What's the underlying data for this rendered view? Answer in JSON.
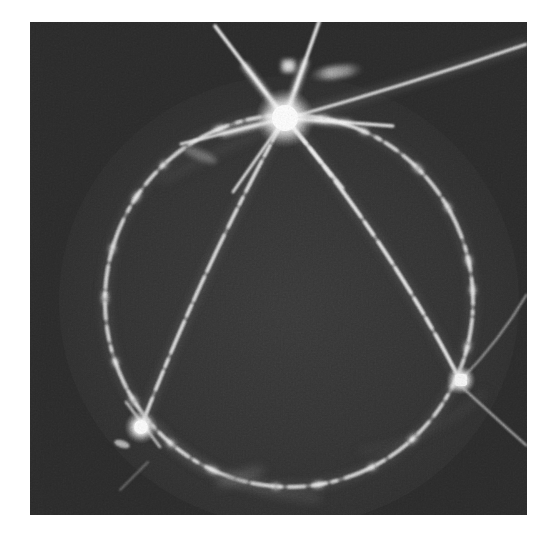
{
  "document": {
    "type": "photographic-plate-image",
    "medium": "grayscale halftone scan",
    "background_page_color": "#ffffff",
    "plate": {
      "x": 30,
      "y": 22,
      "width": 497,
      "height": 493,
      "background_color": "#2b2b2b",
      "interior_color": "#343434",
      "grain": "heavy film grain / halftone noise"
    }
  },
  "scene": {
    "description": "Long-exposure dark-field photograph showing a bright central star burst with six diffraction rays, a large dashed luminous circle, two chord arcs meeting at lower nodes, and a long sweeping streak to the upper right.",
    "feature_count": 9
  },
  "features": {
    "nodes": [
      {
        "id": "node-top",
        "label": "central burst",
        "cx": 285,
        "cy": 118,
        "radius": 17,
        "brightness": "#ffffff",
        "ray_count": 6,
        "notes": "brightest point, six-pointed diffraction spikes"
      },
      {
        "id": "node-lower-left",
        "label": "lower-left node",
        "cx": 141,
        "cy": 427,
        "radius": 9,
        "brightness": "#fdfdfd",
        "ray_count": 4,
        "notes": "secondary bright knot where chord meets circle"
      },
      {
        "id": "node-right",
        "label": "right node",
        "cx": 461,
        "cy": 380,
        "radius": 8,
        "brightness": "#f8f8f8",
        "ray_count": 4,
        "notes": "third bright knot where chord meets circle"
      }
    ],
    "circle": {
      "id": "main-circle",
      "label": "dashed luminous circle",
      "cx": 289,
      "cy": 301,
      "rx": 184,
      "ry": 186,
      "stroke_color": "#d8d8d8",
      "stroke_width": 3,
      "style": "dashed / beaded with bright knots",
      "rotation_deg": -4
    },
    "chords": [
      {
        "id": "chord-left",
        "label": "chord from burst to lower-left node",
        "from": [
          285,
          118
        ],
        "to": [
          141,
          427
        ],
        "curve_control": [
          198,
          268
        ],
        "stroke_color": "#dcdcdc",
        "style": "dashed"
      },
      {
        "id": "chord-right",
        "label": "chord from burst to right node",
        "from": [
          285,
          118
        ],
        "to": [
          461,
          380
        ],
        "curve_control": [
          384,
          243
        ],
        "stroke_color": "#e2e2e2",
        "style": "dashed"
      }
    ],
    "streaks": [
      {
        "id": "streak-upper-right",
        "label": "long sweeping streak to upper right",
        "from": [
          285,
          118
        ],
        "to": [
          530,
          48
        ],
        "curve_control": [
          420,
          70
        ],
        "stroke_color": "#ededed",
        "stroke_width": 2.2
      },
      {
        "id": "streak-upper-left",
        "label": "ray exiting top-left",
        "from": [
          285,
          118
        ],
        "to": [
          214,
          24
        ],
        "stroke_color": "#f2f2f2",
        "stroke_width": 3
      },
      {
        "id": "streak-top",
        "label": "ray exiting top",
        "from": [
          285,
          118
        ],
        "to": [
          316,
          24
        ],
        "stroke_color": "#f2f2f2",
        "stroke_width": 3
      },
      {
        "id": "streak-right-tail",
        "label": "tail leaving right node toward edge",
        "from": [
          461,
          380
        ],
        "to": [
          527,
          440
        ],
        "stroke_color": "#c8c8c8",
        "stroke_width": 2
      },
      {
        "id": "streak-right-upper-tail",
        "label": "tail leaving right node upward-right",
        "from": [
          461,
          380
        ],
        "to": [
          527,
          300
        ],
        "stroke_color": "#b8b8b8",
        "stroke_width": 1.8
      }
    ],
    "blobs": [
      {
        "id": "blob-square",
        "label": "small square knot above burst",
        "cx": 288,
        "cy": 65,
        "width": 12,
        "height": 11,
        "brightness": "#e9e9e9"
      },
      {
        "id": "blob-elongated",
        "label": "elongated smudge right of burst",
        "cx": 337,
        "cy": 72,
        "width": 52,
        "height": 12,
        "rotation_deg": -8,
        "brightness": "#c6c6c6"
      },
      {
        "id": "blob-faint-left",
        "label": "faint smudge lower-left of burst",
        "cx": 200,
        "cy": 155,
        "width": 34,
        "height": 10,
        "rotation_deg": 22,
        "brightness": "#8c8c8c"
      },
      {
        "id": "blob-faint-node",
        "label": "faint smudge left of lower-left node",
        "cx": 122,
        "cy": 444,
        "width": 16,
        "height": 7,
        "rotation_deg": 18,
        "brightness": "#b0b0b0"
      }
    ],
    "diffuse_arcs": [
      {
        "id": "diffuse-arc-bottom-left",
        "label": "faint inner diffuse arc, lower left",
        "stroke_color": "#585858",
        "stroke_width": 7
      },
      {
        "id": "diffuse-arc-inner-top",
        "label": "faint inner halo arc near burst",
        "stroke_color": "#4a4a4a",
        "stroke_width": 6
      }
    ]
  },
  "colors": {
    "page_white": "#ffffff",
    "plate_dark": "#2b2b2b",
    "plate_interior": "#343434",
    "trail_bright": "#ffffff",
    "trail_mid": "#d8d8d8",
    "trail_faint": "#6a6a6a"
  }
}
